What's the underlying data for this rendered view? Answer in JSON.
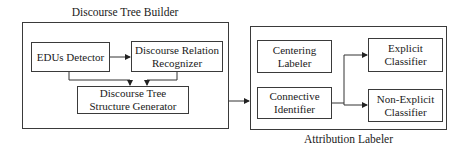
{
  "left_group": {
    "title": "Discourse Tree Builder",
    "nodes": {
      "edus_detector": "EDUs Detector",
      "relation_recognizer": "Discourse Relation Recognizer",
      "structure_generator": "Discourse Tree Structure Generator"
    }
  },
  "right_group": {
    "title": "Attribution Labeler",
    "nodes": {
      "centering_labeler": "Centering Labeler",
      "connective_identifier": "Connective Identifier",
      "explicit_classifier": "Explicit Classifier",
      "non_explicit_classifier": "Non-Explicit Classifier"
    }
  },
  "edges": [
    {
      "from": "EDUs Detector",
      "to": "Discourse Relation Recognizer"
    },
    {
      "from": "EDUs Detector",
      "to": "Discourse Tree Structure Generator"
    },
    {
      "from": "Discourse Relation Recognizer",
      "to": "Discourse Tree Structure Generator"
    },
    {
      "from": "Discourse Tree Builder",
      "to": "Attribution Labeler"
    },
    {
      "from": "Connective Identifier",
      "to": "Explicit Classifier"
    },
    {
      "from": "Connective Identifier",
      "to": "Non-Explicit Classifier"
    }
  ]
}
